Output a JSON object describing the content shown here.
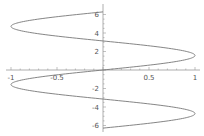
{
  "chart_data": {
    "type": "line",
    "title": "",
    "xlabel": "",
    "ylabel": "",
    "xlim": [
      -1,
      1
    ],
    "ylim": [
      -6.28,
      6.28
    ],
    "grid": false,
    "legend": null,
    "x_ticks": [
      -1,
      -0.5,
      0.5,
      1
    ],
    "x_tick_labels": [
      "-1",
      "-0.5",
      "0.5",
      "1"
    ],
    "y_ticks": [
      6,
      4,
      2,
      -2,
      -4,
      -6
    ],
    "y_tick_labels": [
      "6",
      "4",
      "2",
      "-2",
      "-4",
      "-6"
    ],
    "series": [
      {
        "name": "x = sin(y)",
        "color": "#777777",
        "t_range": [
          -6.2832,
          6.2832
        ],
        "points_sample": [
          {
            "x": 0,
            "y": -6.28
          },
          {
            "x": 1,
            "y": -4.71
          },
          {
            "x": 0,
            "y": -3.14
          },
          {
            "x": -1,
            "y": -1.57
          },
          {
            "x": 0,
            "y": 0
          },
          {
            "x": 1,
            "y": 1.57
          },
          {
            "x": 0,
            "y": 3.14
          },
          {
            "x": -1,
            "y": 4.71
          },
          {
            "x": 0,
            "y": 6.28
          }
        ]
      }
    ]
  },
  "layout": {
    "x_px_min": 11,
    "x_px_max": 195,
    "y_px_zero": 70,
    "px_per_y_unit": 9.25,
    "axis_color": "#999999",
    "curve_color": "#777777"
  }
}
